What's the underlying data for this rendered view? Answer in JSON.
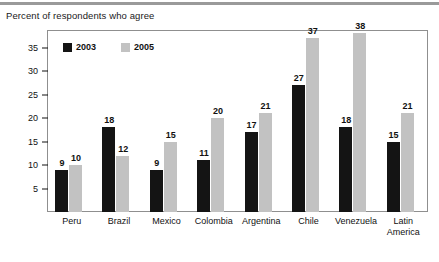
{
  "chart_data": {
    "type": "bar",
    "title": "Percent of respondents who agree",
    "xlabel": "",
    "ylabel": "",
    "ylim": [
      0,
      38
    ],
    "yticks": [
      5,
      10,
      15,
      20,
      25,
      30,
      35
    ],
    "grid": false,
    "legend_position": "top-left-inside",
    "categories": [
      "Peru",
      "Brazil",
      "Mexico",
      "Colombia",
      "Argentina",
      "Chile",
      "Venezuela",
      "Latin America"
    ],
    "series": [
      {
        "name": "2003",
        "color": "#141414",
        "values": [
          9,
          18,
          9,
          11,
          17,
          27,
          18,
          15
        ]
      },
      {
        "name": "2005",
        "color": "#c2c2c2",
        "values": [
          10,
          12,
          15,
          20,
          21,
          37,
          38,
          21
        ]
      }
    ]
  },
  "legend": {
    "items": [
      {
        "label": "2003",
        "color": "#141414"
      },
      {
        "label": "2005",
        "color": "#c2c2c2"
      }
    ]
  },
  "axis": {
    "tick_labels": [
      "35",
      "30",
      "25",
      "20",
      "15",
      "10",
      "5"
    ]
  },
  "category_labels": [
    {
      "line1": "Peru",
      "line2": ""
    },
    {
      "line1": "Brazil",
      "line2": ""
    },
    {
      "line1": "Mexico",
      "line2": ""
    },
    {
      "line1": "Colombia",
      "line2": ""
    },
    {
      "line1": "Argentina",
      "line2": ""
    },
    {
      "line1": "Chile",
      "line2": ""
    },
    {
      "line1": "Venezuela",
      "line2": ""
    },
    {
      "line1": "Latin",
      "line2": "America"
    }
  ]
}
